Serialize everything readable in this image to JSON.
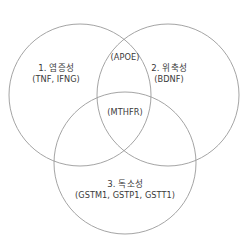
{
  "figure": {
    "type": "venn-diagram-3-set",
    "background_color": "#ffffff",
    "stroke_color": "#9a9a9a",
    "text_color": "#3a3a3a"
  },
  "sets": [
    {
      "id": "set1",
      "title": "1. 염증성",
      "genes": "(TNF, IFNG)",
      "position": "left"
    },
    {
      "id": "set2",
      "title": "2. 위축성",
      "genes": "(BDNF)",
      "position": "right"
    },
    {
      "id": "set3",
      "title": "3. 독소성",
      "genes": "(GSTM1, GSTP1, GSTT1)",
      "position": "bottom"
    }
  ],
  "intersections": [
    {
      "id": "intersect-top",
      "label": "(APOE)",
      "between": "set1-set2"
    },
    {
      "id": "intersect-center",
      "label": "(MTHFR)",
      "between": "set1-set2-set3"
    }
  ]
}
